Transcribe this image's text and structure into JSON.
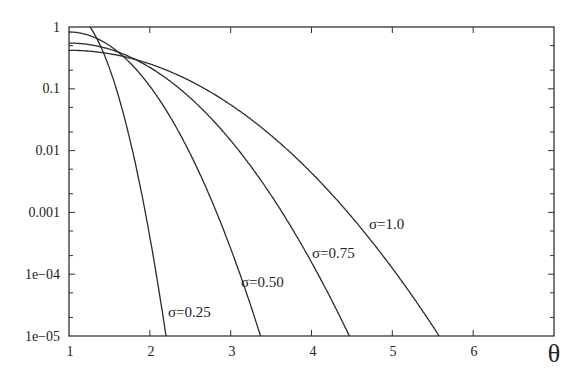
{
  "chart_data": {
    "type": "line",
    "title": "",
    "xlabel": "θ",
    "ylabel": "",
    "xlim": [
      1,
      7
    ],
    "ylim": [
      1e-05,
      1
    ],
    "yscale": "log",
    "grid": false,
    "legend": "inline labels near curves",
    "x_ticks": [
      "1",
      "2",
      "3",
      "4",
      "5",
      "6"
    ],
    "y_ticks": [
      "1",
      "0.1",
      "0.01",
      "0.001",
      "1e-04",
      "1e-05"
    ],
    "series": [
      {
        "name": "σ=0.25",
        "x": [
          1.26,
          1.4,
          1.6,
          1.8,
          2.0,
          2.2
        ],
        "values": [
          1.0,
          0.37,
          0.052,
          0.0042,
          0.00021,
          1e-05
        ]
      },
      {
        "name": "σ=0.50",
        "x": [
          1.0,
          1.5,
          2.0,
          2.5,
          3.0,
          3.37
        ],
        "values": [
          0.83,
          0.5,
          0.11,
          0.0087,
          0.00026,
          1e-05
        ]
      },
      {
        "name": "σ=0.75",
        "x": [
          1.0,
          1.5,
          2.0,
          2.5,
          3.0,
          3.5,
          4.0,
          4.47
        ],
        "values": [
          0.55,
          0.44,
          0.22,
          0.071,
          0.0145,
          0.0019,
          0.00015,
          1e-05
        ]
      },
      {
        "name": "σ=1.0",
        "x": [
          1.0,
          1.5,
          2.0,
          2.5,
          3.0,
          3.5,
          4.0,
          4.5,
          5.0,
          5.58
        ],
        "values": [
          0.42,
          0.37,
          0.25,
          0.13,
          0.052,
          0.016,
          0.0039,
          0.00072,
          0.0001,
          1e-05
        ]
      }
    ],
    "annotations": [
      {
        "text": "σ=0.25",
        "x": 2.2,
        "y": 2.5e-05
      },
      {
        "text": "σ=0.50",
        "x": 3.2,
        "y": 0.00011
      },
      {
        "text": "σ=0.75",
        "x": 3.95,
        "y": 0.0005
      },
      {
        "text": "σ=1.0",
        "x": 4.7,
        "y": 0.0021
      }
    ]
  },
  "model": {
    "comment_free_params": true,
    "curves": [
      {
        "a": 0.246,
        "b": 3.643,
        "xmax": 2.2
      },
      {
        "a": -0.081,
        "b": 0.876,
        "xmax": 3.37
      },
      {
        "a": -0.26,
        "b": 0.394,
        "xmax": 4.47
      },
      {
        "a": -0.377,
        "b": 0.2204,
        "xmax": 5.58
      }
    ]
  },
  "labels": {
    "curve_025": "σ=0.25",
    "curve_050": "σ=0.50",
    "curve_075": "σ=0.75",
    "curve_100": "σ=1.0",
    "x_axis_var": "θ",
    "y1": "1",
    "y2": "0.1",
    "y3": "0.01",
    "y4": "0.001",
    "y5": "1e−04",
    "y6": "1e−05",
    "x1": "1",
    "x2": "2",
    "x3": "3",
    "x4": "4",
    "x5": "5",
    "x6": "6"
  }
}
